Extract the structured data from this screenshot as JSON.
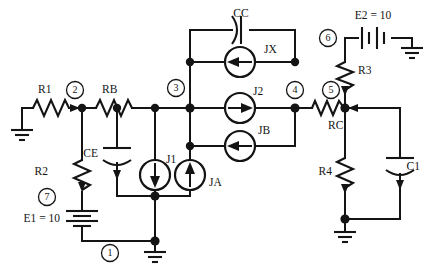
{
  "diagram": {
    "background_color": "#ffffff",
    "ink_color": "#141414",
    "width": 428,
    "height": 279
  },
  "components": {
    "r1": {
      "label": "R1",
      "type": "resistor"
    },
    "rb": {
      "label": "RB",
      "type": "resistor"
    },
    "r2": {
      "label": "R2",
      "type": "resistor"
    },
    "r3": {
      "label": "R3",
      "type": "resistor"
    },
    "r4": {
      "label": "R4",
      "type": "resistor"
    },
    "rc": {
      "label": "RC",
      "type": "resistor"
    },
    "ce": {
      "label": "CE",
      "type": "capacitor"
    },
    "cc": {
      "label": "CC",
      "type": "capacitor"
    },
    "c1": {
      "label": "C1",
      "type": "capacitor"
    },
    "e1": {
      "label": "E1 = 10",
      "type": "battery"
    },
    "e2": {
      "label": "E2 = 10",
      "type": "battery"
    },
    "j1": {
      "label": "J1",
      "type": "current-source",
      "direction": "down"
    },
    "ja": {
      "label": "JA",
      "type": "current-source",
      "direction": "up"
    },
    "jx": {
      "label": "JX",
      "type": "current-source",
      "direction": "left"
    },
    "j2": {
      "label": "J2",
      "type": "current-source",
      "direction": "right"
    },
    "jb": {
      "label": "JB",
      "type": "current-source",
      "direction": "left"
    }
  },
  "nodes": [
    {
      "id": "n1",
      "label": "1"
    },
    {
      "id": "n2",
      "label": "2"
    },
    {
      "id": "n3",
      "label": "3"
    },
    {
      "id": "n4",
      "label": "4"
    },
    {
      "id": "n5",
      "label": "5"
    },
    {
      "id": "n6",
      "label": "6"
    },
    {
      "id": "n7",
      "label": "7"
    }
  ],
  "grounds": [
    {
      "id": "gnd-left"
    },
    {
      "id": "gnd-bottom-center"
    },
    {
      "id": "gnd-bottom-right"
    },
    {
      "id": "gnd-top-right"
    }
  ]
}
